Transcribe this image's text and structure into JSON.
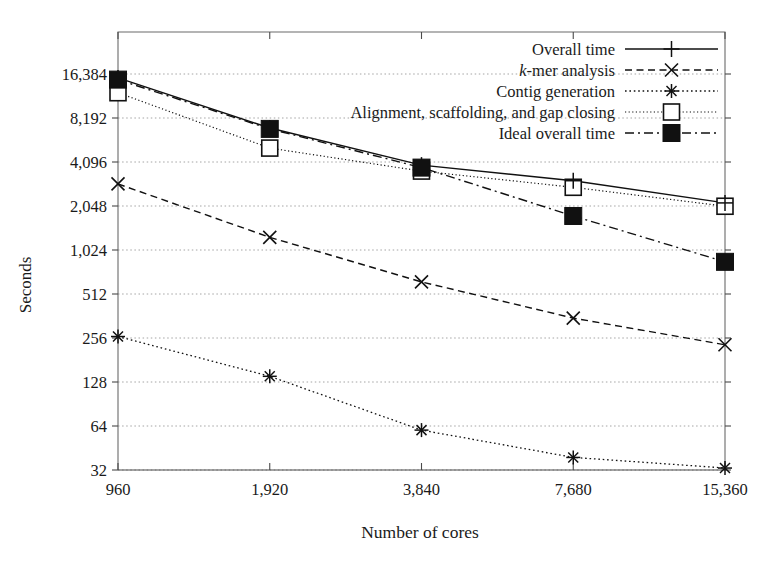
{
  "chart_data": {
    "type": "line",
    "title": "",
    "xlabel": "Number of cores",
    "ylabel": "Seconds",
    "x": [
      960,
      1920,
      3840,
      7680,
      15360
    ],
    "xtick_labels": [
      "960",
      "1,920",
      "3,840",
      "7,680",
      "15,360"
    ],
    "x_scale": "log2",
    "y_scale": "log2",
    "ytick_values": [
      32,
      64,
      128,
      256,
      512,
      1024,
      2048,
      4096,
      8192,
      16384
    ],
    "ytick_labels": [
      "32",
      "64",
      "128",
      "256",
      "512",
      "1,024",
      "2,048",
      "4,096",
      "8,192",
      "16,384"
    ],
    "ylim": [
      32,
      22000
    ],
    "grid": true,
    "legend_position": "top-right",
    "series": [
      {
        "name": "Overall time",
        "marker": "plus",
        "linestyle": "solid",
        "values": [
          15400,
          7000,
          3900,
          3050,
          2150
        ]
      },
      {
        "name": "k-mer analysis",
        "marker": "cross",
        "linestyle": "dashed",
        "italic_prefix": "k",
        "values": [
          2900,
          1250,
          620,
          350,
          230
        ]
      },
      {
        "name": "Contig generation",
        "marker": "asterisk",
        "linestyle": "dotted",
        "values": [
          262,
          140,
          60,
          39,
          33
        ]
      },
      {
        "name": "Alignment, scaffolding, and gap closing",
        "marker": "open-square",
        "linestyle": "fine-dotted",
        "values": [
          12200,
          5100,
          3550,
          2750,
          2040
        ]
      },
      {
        "name": "Ideal overall time",
        "marker": "filled-square",
        "linestyle": "dash-dot",
        "values": [
          15000,
          6900,
          3750,
          1750,
          850
        ]
      }
    ],
    "colors": {
      "ink": "#111111",
      "axis": "#4a4a4a",
      "grid": "#9a9a9a",
      "background": "#ffffff"
    }
  },
  "legend": {
    "entries": [
      {
        "label": "Overall time"
      },
      {
        "label": "k-mer analysis",
        "label_plain": "-mer analysis",
        "italic_head": "k"
      },
      {
        "label": "Contig generation"
      },
      {
        "label": "Alignment, scaffolding, and gap closing"
      },
      {
        "label": "Ideal overall time"
      }
    ]
  }
}
